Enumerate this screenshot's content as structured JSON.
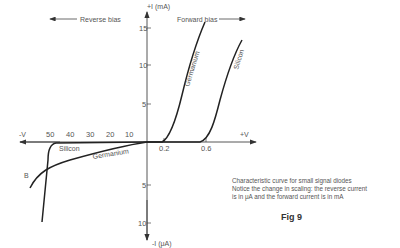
{
  "diagram": {
    "labels": {
      "reverse_bias": "Reverse bias",
      "forward_bias": "Forward bias",
      "y_pos": "+I (mA)",
      "y_neg": "-I (μA)",
      "x_pos": "+V",
      "x_neg": "-V",
      "breakdown": "B"
    },
    "curves": {
      "germanium_fwd": "Germanium",
      "silicon_fwd": "Silicon",
      "silicon_rev": "Silicon",
      "germanium_rev": "Germanium"
    },
    "ticks": {
      "y_pos": [
        "15",
        "10",
        "5"
      ],
      "y_neg": [
        "5",
        "10"
      ],
      "x_neg": [
        "50",
        "40",
        "30",
        "20",
        "10"
      ],
      "x_pos": [
        "0.2",
        "0.6"
      ]
    },
    "caption": {
      "line1": "Characteristic curve for small signal diodes",
      "line2": "Notice the change in scaling: the reverse current",
      "line3": "is in μA and the forward current is in mA"
    },
    "figure_label": "Fig 9",
    "colors": {
      "curve": "#222222",
      "axis": "#444444",
      "text": "#555555"
    }
  }
}
